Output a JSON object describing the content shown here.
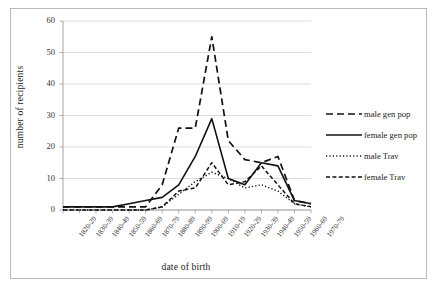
{
  "chart_data": {
    "type": "line",
    "title": "",
    "xlabel": "date of birth",
    "ylabel": "number of recipients",
    "ylim": [
      0,
      60
    ],
    "ytick_values": [
      0,
      10,
      20,
      30,
      40,
      50,
      60
    ],
    "grid": "horizontal",
    "legend_position": "right",
    "categories": [
      "1820-29",
      "1830-39",
      "1840-49",
      "1850-59",
      "1860-69",
      "1870-79",
      "1880-89",
      "1890-99",
      "1900-09",
      "1910-19",
      "1920-29",
      "1930-39",
      "1940-49",
      "1950-59",
      "1960-69",
      "1970-79"
    ],
    "series": [
      {
        "name": "male gen pop",
        "style": "dashed",
        "values": [
          1,
          1,
          1,
          1,
          1,
          1,
          8,
          26,
          26,
          55,
          22,
          16,
          15,
          17,
          3,
          2
        ]
      },
      {
        "name": "female gen pop",
        "style": "solid",
        "values": [
          1,
          1,
          1,
          1,
          2,
          3,
          4,
          8,
          17,
          29,
          10,
          8,
          15,
          14,
          3,
          2
        ]
      },
      {
        "name": "male Trav",
        "style": "dotted",
        "values": [
          0,
          0,
          0,
          0,
          0,
          0,
          1,
          5,
          9,
          12,
          10,
          7,
          8,
          6,
          2,
          1
        ]
      },
      {
        "name": "female Trav",
        "style": "dash-dot",
        "values": [
          0,
          0,
          0,
          0,
          0,
          0,
          1,
          6,
          7,
          15,
          8,
          9,
          14,
          8,
          2,
          1
        ]
      }
    ]
  },
  "legend": {
    "items": [
      {
        "label": "male gen pop"
      },
      {
        "label": "female gen pop"
      },
      {
        "label": "male Trav"
      },
      {
        "label": "female Trav"
      }
    ]
  },
  "colors": {
    "line": "#111111",
    "grid": "#d4d4d4",
    "axis": "#9a9a9a",
    "border": "#b9b9b9",
    "text": "#222222",
    "background": "#ffffff"
  }
}
